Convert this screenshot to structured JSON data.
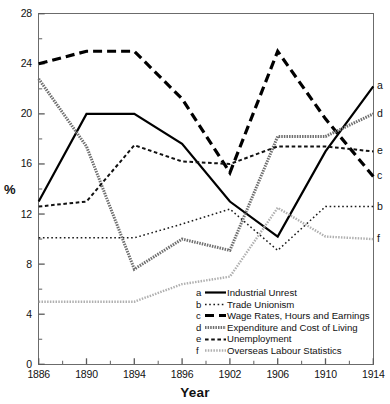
{
  "chart_data": {
    "type": "line",
    "title": "",
    "xlabel": "Year",
    "ylabel": "%",
    "categories": [
      "1886",
      "1890",
      "1894",
      "1896",
      "1902",
      "1906",
      "1910",
      "1914"
    ],
    "ylim": [
      0,
      28
    ],
    "ytick_labels": [
      "0",
      "4",
      "8",
      "12",
      "16",
      "20",
      "24",
      "28"
    ],
    "ytick_values": [
      0,
      4,
      8,
      12,
      16,
      20,
      24,
      28
    ],
    "yminor_values": [
      2,
      6,
      10,
      14,
      18,
      22,
      26
    ],
    "grid": false,
    "legend_position": "inside lower-right",
    "series": [
      {
        "key": "a",
        "name": "Industrial Unrest",
        "style": "solid",
        "color": "#000000",
        "width": 2.2,
        "edge_label": "a",
        "values": [
          13.0,
          20.0,
          20.0,
          17.6,
          13.0,
          10.2,
          17.0,
          22.2
        ]
      },
      {
        "key": "b",
        "name": "Trade Unionism",
        "style": "fine-dotted",
        "color": "#1a1a1a",
        "width": 1.5,
        "edge_label": "b",
        "values": [
          10.1,
          10.1,
          10.1,
          11.2,
          12.4,
          9.1,
          12.6,
          12.6
        ]
      },
      {
        "key": "c",
        "name": "Wage Rates, Hours and Earnings",
        "style": "thick-dashed",
        "color": "#000000",
        "width": 3.2,
        "edge_label": "c",
        "values": [
          24.0,
          25.0,
          25.0,
          21.2,
          15.3,
          25.0,
          19.6,
          15.0
        ]
      },
      {
        "key": "d",
        "name": "Expenditure and Cost of Living",
        "style": "thick-dotted-gray",
        "color": "#6f6f6f",
        "width": 3.0,
        "edge_label": "d",
        "values": [
          22.8,
          17.4,
          7.6,
          10.0,
          9.1,
          18.2,
          18.2,
          20.0
        ]
      },
      {
        "key": "e",
        "name": "Unemployment",
        "style": "medium-dashed",
        "color": "#111111",
        "width": 2.0,
        "edge_label": "e",
        "values": [
          12.6,
          13.0,
          17.5,
          16.2,
          16.0,
          17.4,
          17.4,
          17.0
        ]
      },
      {
        "key": "f",
        "name": "Overseas Labour Statistics",
        "style": "light-gray-dotted",
        "color": "#b0b0b0",
        "width": 2.4,
        "edge_label": "f",
        "values": [
          5.0,
          5.0,
          5.0,
          6.4,
          7.0,
          12.5,
          10.2,
          10.0
        ]
      }
    ],
    "legend_entries": [
      {
        "key": "a",
        "label": "Industrial Unrest",
        "style": "solid"
      },
      {
        "key": "b",
        "label": "Trade Unionism",
        "style": "fine-dotted"
      },
      {
        "key": "c",
        "label": "Wage Rates, Hours and Earnings",
        "style": "thick-dashed"
      },
      {
        "key": "d",
        "label": "Expenditure and Cost of Living",
        "style": "thick-dotted-gray"
      },
      {
        "key": "e",
        "label": "Unemployment",
        "style": "medium-dashed"
      },
      {
        "key": "f",
        "label": "Overseas Labour Statistics",
        "style": "light-gray-dotted"
      }
    ]
  }
}
